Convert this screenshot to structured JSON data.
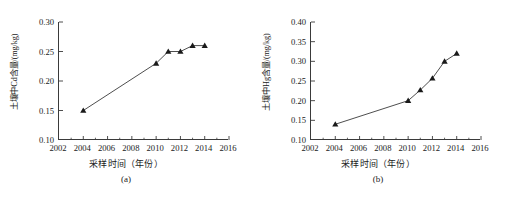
{
  "figure": {
    "panels": [
      {
        "caption": "(a)",
        "xlabel": "采样时间（年份）",
        "ylabel": "土壤中Cd含量/(mg/kg)",
        "chart_data": {
          "type": "line",
          "title": "",
          "xlabel": "采样时间（年份）",
          "ylabel": "土壤中Cd含量/(mg/kg)",
          "xlim": [
            2002,
            2016
          ],
          "ylim": [
            0.1,
            0.3
          ],
          "xticks": [
            2002,
            2004,
            2006,
            2008,
            2010,
            2012,
            2014,
            2016
          ],
          "xticklabels": [
            "2002",
            "2004",
            "2006",
            "2008",
            "2010",
            "2012",
            "2014",
            "2016"
          ],
          "yticks": [
            0.1,
            0.15,
            0.2,
            0.25,
            0.3
          ],
          "yticklabels": [
            "0.10",
            "0.15",
            "0.20",
            "0.25",
            "0.30"
          ],
          "minor_xticks": [
            2003,
            2005,
            2007,
            2009,
            2011,
            2013,
            2015
          ],
          "grid": false,
          "legend": false,
          "marker": "triangle-filled",
          "line_color": "#3a3a3a",
          "marker_color": "#1a1a1a",
          "x": [
            2004,
            2010,
            2011,
            2012,
            2013,
            2014
          ],
          "values": [
            0.15,
            0.23,
            0.25,
            0.25,
            0.26,
            0.26
          ]
        }
      },
      {
        "caption": "(b)",
        "xlabel": "采样时间（年份）",
        "ylabel": "土壤中Hg含量/(mg/kg)",
        "chart_data": {
          "type": "line",
          "title": "",
          "xlabel": "采样时间（年份）",
          "ylabel": "土壤中Hg含量/(mg/kg)",
          "xlim": [
            2002,
            2016
          ],
          "ylim": [
            0.1,
            0.4
          ],
          "xticks": [
            2002,
            2004,
            2006,
            2008,
            2010,
            2012,
            2014,
            2016
          ],
          "xticklabels": [
            "2002",
            "2004",
            "2006",
            "2008",
            "2010",
            "2012",
            "2014",
            "2016"
          ],
          "yticks": [
            0.1,
            0.15,
            0.2,
            0.25,
            0.3,
            0.35,
            0.4
          ],
          "yticklabels": [
            "0.10",
            "0.15",
            "0.20",
            "0.25",
            "0.30",
            "0.35",
            "0.40"
          ],
          "minor_xticks": [
            2003,
            2005,
            2007,
            2009,
            2011,
            2013,
            2015
          ],
          "grid": false,
          "legend": false,
          "marker": "triangle-filled",
          "line_color": "#3a3a3a",
          "marker_color": "#1a1a1a",
          "x": [
            2004,
            2010,
            2011,
            2012,
            2013,
            2014
          ],
          "values": [
            0.14,
            0.2,
            0.227,
            0.257,
            0.3,
            0.32
          ]
        }
      }
    ]
  }
}
